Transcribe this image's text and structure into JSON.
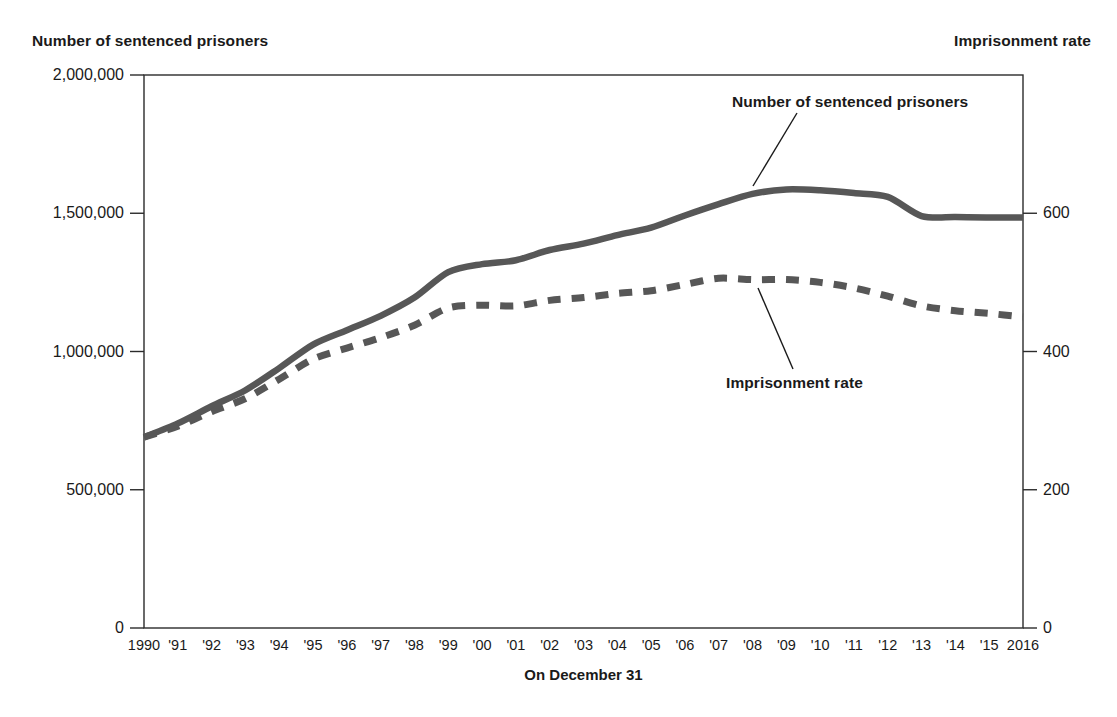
{
  "figure": {
    "left_axis_title": "Number of sentenced prisoners",
    "right_axis_title": "Imprisonment rate",
    "xaxis_title": "On December 31",
    "annotations": {
      "prisoners": "Number of sentenced prisoners",
      "rate": "Imprisonment rate"
    },
    "colors": {
      "line": "#575757",
      "axis": "#2b2b2b",
      "text": "#1a1a1a",
      "background": "#ffffff"
    }
  },
  "chart_data": {
    "type": "line",
    "title": "",
    "subtitle": "",
    "xlabel": "On December 31",
    "ylabel": "Number of sentenced prisoners",
    "y2label": "Imprisonment rate",
    "grid": false,
    "legend": "annotations-with-leader-lines",
    "x": [
      1990,
      1991,
      1992,
      1993,
      1994,
      1995,
      1996,
      1997,
      1998,
      1999,
      2000,
      2001,
      2002,
      2003,
      2004,
      2005,
      2006,
      2007,
      2008,
      2009,
      2010,
      2011,
      2012,
      2013,
      2014,
      2015,
      2016
    ],
    "xtick_labels": [
      "1990",
      "'91",
      "'92",
      "'93",
      "'94",
      "'95",
      "'96",
      "'97",
      "'98",
      "'99",
      "'00",
      "'01",
      "'02",
      "'03",
      "'04",
      "'05",
      "'06",
      "'07",
      "'08",
      "'09",
      "'10",
      "'11",
      "'12",
      "'13",
      "'14",
      "'15",
      "2016"
    ],
    "ylim": [
      0,
      2000000
    ],
    "ytick_values": [
      0,
      500000,
      1000000,
      1500000,
      2000000
    ],
    "ytick_labels": [
      "0",
      "500,000",
      "1,000,000",
      "1,500,000",
      "2,000,000"
    ],
    "y2lim": [
      0,
      800
    ],
    "y2tick_values": [
      0,
      200,
      400,
      600
    ],
    "y2tick_labels": [
      "0",
      "200",
      "400",
      "600"
    ],
    "series": [
      {
        "name": "Number of sentenced prisoners",
        "axis": "left",
        "style": "solid",
        "values": [
          689577,
          740000,
          802000,
          860000,
          940000,
          1025000,
          1077000,
          1129000,
          1195000,
          1287000,
          1316000,
          1330000,
          1367000,
          1390000,
          1421000,
          1448000,
          1492000,
          1533000,
          1570000,
          1586000,
          1583000,
          1573000,
          1559000,
          1490000,
          1486000,
          1485000,
          1485000
        ]
      },
      {
        "name": "Imprisonment rate",
        "axis": "right",
        "style": "dashed",
        "values": [
          276,
          292,
          313,
          332,
          360,
          389,
          405,
          420,
          438,
          463,
          467,
          466,
          474,
          478,
          484,
          488,
          497,
          506,
          504,
          504,
          500,
          492,
          480,
          466,
          459,
          455,
          450
        ]
      }
    ]
  }
}
